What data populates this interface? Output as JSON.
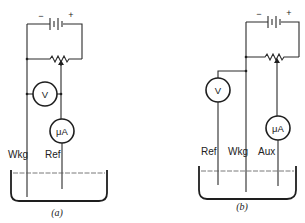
{
  "figure": {
    "panels": [
      {
        "id": "a",
        "caption": "(a)",
        "battery": {
          "minus": "−",
          "plus": "+"
        },
        "meters": [
          {
            "symbol": "V",
            "name": "voltmeter"
          },
          {
            "symbol": "μA",
            "name": "microammeter"
          }
        ],
        "electrodes": [
          "Wkg",
          "Ref"
        ]
      },
      {
        "id": "b",
        "caption": "(b)",
        "battery": {
          "minus": "−",
          "plus": "+"
        },
        "meters": [
          {
            "symbol": "V",
            "name": "voltmeter"
          },
          {
            "symbol": "μA",
            "name": "microammeter"
          }
        ],
        "electrodes": [
          "Ref",
          "Wkg",
          "Aux"
        ]
      }
    ]
  }
}
